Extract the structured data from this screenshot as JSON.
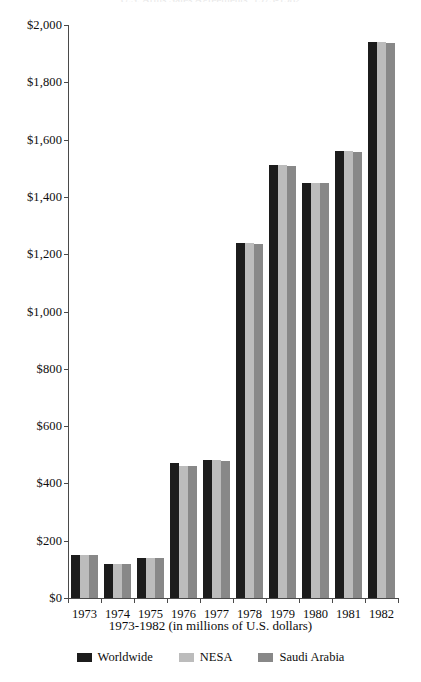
{
  "chart": {
    "title": "U.S. Arms Sales Agreements, 1973-1982",
    "x_caption": "1973-1982 (in millions of U.S. dollars)"
  },
  "legend": {
    "position": "bottom-center",
    "items": [
      {
        "label": "Worldwide",
        "color": "#1c1c1c",
        "swatch_name": "legend-swatch-worldwide"
      },
      {
        "label": "NESA",
        "color": "#bcbcbc",
        "swatch_name": "legend-swatch-nesa"
      },
      {
        "label": "Saudi Arabia",
        "color": "#888888",
        "swatch_name": "legend-swatch-saudi-arabia"
      }
    ]
  },
  "axes": {
    "y_tick_labels": [
      "$2,000",
      "$1,800",
      "$1,600",
      "$1,400",
      "$1,200",
      "$1,000",
      "$800",
      "$600",
      "$400",
      "$200",
      "$0"
    ],
    "y_tick_values": [
      2000,
      1800,
      1600,
      1400,
      1200,
      1000,
      800,
      600,
      400,
      200,
      0
    ],
    "x_tick_labels": [
      "1973",
      "1974",
      "1975",
      "1976",
      "1977",
      "1978",
      "1979",
      "1980",
      "1981",
      "1982"
    ]
  },
  "chart_data": {
    "type": "bar",
    "title": "U.S. Arms Sales Agreements, 1973-1982",
    "xlabel": "1973-1982 (in millions of U.S. dollars)",
    "ylabel": "",
    "ylim": [
      0,
      2000
    ],
    "ytick_step": 200,
    "grid": false,
    "legend_position": "bottom-center",
    "categories": [
      "1973",
      "1974",
      "1975",
      "1976",
      "1977",
      "1978",
      "1979",
      "1980",
      "1981",
      "1982"
    ],
    "series": [
      {
        "name": "Worldwide",
        "color": "#1c1c1c",
        "values": [
          150,
          120,
          140,
          470,
          480,
          1240,
          1510,
          1450,
          1560,
          1940
        ]
      },
      {
        "name": "NESA",
        "color": "#bcbcbc",
        "values": [
          150,
          120,
          140,
          462,
          480,
          1240,
          1510,
          1450,
          1560,
          1940
        ]
      },
      {
        "name": "Saudi Arabia",
        "color": "#888888",
        "values": [
          150,
          120,
          140,
          460,
          478,
          1235,
          1508,
          1448,
          1558,
          1938
        ]
      }
    ]
  }
}
